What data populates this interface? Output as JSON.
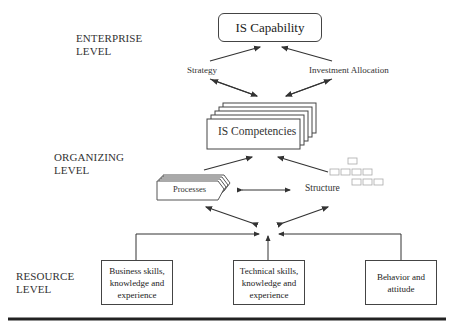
{
  "levels": {
    "enterprise": [
      "ENTERPRISE",
      "LEVEL"
    ],
    "organizing": [
      "ORGANIZING",
      "LEVEL"
    ],
    "resource": [
      "RESOURCE",
      "LEVEL"
    ]
  },
  "nodes": {
    "is_capability": "IS Capability",
    "strategy": "Strategy",
    "investment_allocation": "Investment  Allocation",
    "is_competencies": "IS Competencies",
    "processes": "Processes",
    "structure": "Structure",
    "business_skills": [
      "Business skills,",
      "knowledge and",
      "experience"
    ],
    "technical_skills": [
      "Technical skills,",
      "knowledge and",
      "experience"
    ],
    "behavior": [
      "Behavior and",
      "attitude"
    ]
  },
  "colors": {
    "stroke": "#333333",
    "rule": "#222222",
    "faint": "#aaaaaa"
  }
}
